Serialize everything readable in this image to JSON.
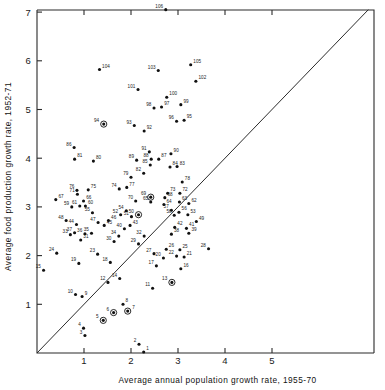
{
  "figure": {
    "title": "",
    "background_color": "#ffffff",
    "ink_color": "#111111"
  },
  "chart_data": {
    "type": "scatter",
    "title": "",
    "xlabel": "Average annual population growth rate, 1955-70",
    "ylabel": "Average food production growth rate, 1952-71",
    "xlim": [
      0,
      5.9
    ],
    "ylim": [
      0,
      7.15
    ],
    "xticks": [
      1,
      2,
      3,
      4,
      5
    ],
    "yticks": [
      1,
      2,
      3,
      4,
      5,
      6,
      7
    ],
    "xtick_labels": [
      "1",
      "2",
      "3",
      "4",
      "5"
    ],
    "ytick_labels": [
      "1",
      "2",
      "3",
      "4",
      "5",
      "6",
      "7"
    ],
    "grid": false,
    "legend": null,
    "annotations": [
      {
        "kind": "reference-line",
        "description": "45-degree diagonal line y = x from origin to top-right corner",
        "x0": 0.0,
        "y0": 0.0,
        "x1": 7.05,
        "y1": 7.05
      }
    ],
    "marker_styles": {
      "plain": "filled black dot",
      "circled": "filled black dot enclosed in an open circle"
    },
    "points": [
      {
        "label": "1",
        "x": 2.27,
        "y": 0.02,
        "style": "plain"
      },
      {
        "label": "2",
        "x": 2.17,
        "y": 0.18,
        "style": "plain"
      },
      {
        "label": "3",
        "x": 1.02,
        "y": 0.36,
        "style": "plain"
      },
      {
        "label": "4",
        "x": 0.99,
        "y": 0.51,
        "style": "plain"
      },
      {
        "label": "5",
        "x": 1.41,
        "y": 0.67,
        "style": "circled"
      },
      {
        "label": "6",
        "x": 1.63,
        "y": 0.83,
        "style": "circled"
      },
      {
        "label": "7",
        "x": 1.93,
        "y": 0.86,
        "style": "circled"
      },
      {
        "label": "8",
        "x": 1.83,
        "y": 1.0,
        "style": "plain"
      },
      {
        "label": "9",
        "x": 0.96,
        "y": 1.16,
        "style": "plain"
      },
      {
        "label": "10",
        "x": 0.82,
        "y": 1.2,
        "style": "plain"
      },
      {
        "label": "11",
        "x": 2.46,
        "y": 1.33,
        "style": "plain"
      },
      {
        "label": "12",
        "x": 1.51,
        "y": 1.45,
        "style": "plain"
      },
      {
        "label": "13",
        "x": 2.87,
        "y": 1.45,
        "style": "circled"
      },
      {
        "label": "14",
        "x": 1.76,
        "y": 1.53,
        "style": "plain"
      },
      {
        "label": "15",
        "x": 0.14,
        "y": 1.7,
        "style": "plain"
      },
      {
        "label": "16",
        "x": 3.06,
        "y": 1.73,
        "style": "plain"
      },
      {
        "label": "17",
        "x": 2.54,
        "y": 1.79,
        "style": "plain"
      },
      {
        "label": "18",
        "x": 1.56,
        "y": 1.86,
        "style": "plain"
      },
      {
        "label": "19",
        "x": 0.89,
        "y": 1.84,
        "style": "plain"
      },
      {
        "label": "20",
        "x": 2.69,
        "y": 1.95,
        "style": "plain"
      },
      {
        "label": "21",
        "x": 3.13,
        "y": 1.97,
        "style": "plain"
      },
      {
        "label": "22",
        "x": 2.97,
        "y": 1.99,
        "style": "plain"
      },
      {
        "label": "23",
        "x": 1.29,
        "y": 2.03,
        "style": "plain"
      },
      {
        "label": "24",
        "x": 0.42,
        "y": 2.05,
        "style": "plain"
      },
      {
        "label": "25",
        "x": 3.04,
        "y": 2.12,
        "style": "plain"
      },
      {
        "label": "26",
        "x": 2.75,
        "y": 2.13,
        "style": "plain"
      },
      {
        "label": "27",
        "x": 2.49,
        "y": 2.04,
        "style": "plain"
      },
      {
        "label": "28",
        "x": 3.65,
        "y": 2.14,
        "style": "plain"
      },
      {
        "label": "29",
        "x": 2.16,
        "y": 2.24,
        "style": "plain"
      },
      {
        "label": "30",
        "x": 1.64,
        "y": 2.29,
        "style": "plain"
      },
      {
        "label": "31",
        "x": 0.93,
        "y": 2.32,
        "style": "plain"
      },
      {
        "label": "32",
        "x": 2.28,
        "y": 2.4,
        "style": "plain"
      },
      {
        "label": "33",
        "x": 0.71,
        "y": 2.43,
        "style": "plain"
      },
      {
        "label": "34",
        "x": 1.74,
        "y": 2.4,
        "style": "plain"
      },
      {
        "label": "35",
        "x": 1.16,
        "y": 2.46,
        "style": "plain"
      },
      {
        "label": "36",
        "x": 1.02,
        "y": 2.45,
        "style": "plain"
      },
      {
        "label": "37",
        "x": 0.8,
        "y": 2.47,
        "style": "plain"
      },
      {
        "label": "38",
        "x": 2.86,
        "y": 2.44,
        "style": "plain"
      },
      {
        "label": "39",
        "x": 3.23,
        "y": 2.46,
        "style": "plain"
      },
      {
        "label": "40",
        "x": 1.86,
        "y": 2.55,
        "style": "plain"
      },
      {
        "label": "41",
        "x": 3.18,
        "y": 2.56,
        "style": "plain"
      },
      {
        "label": "42",
        "x": 2.93,
        "y": 2.58,
        "style": "plain"
      },
      {
        "label": "43",
        "x": 1.98,
        "y": 2.62,
        "style": "plain"
      },
      {
        "label": "44",
        "x": 0.84,
        "y": 2.64,
        "style": "plain"
      },
      {
        "label": "45",
        "x": 1.43,
        "y": 2.62,
        "style": "plain"
      },
      {
        "label": "46",
        "x": 1.52,
        "y": 2.72,
        "style": "plain"
      },
      {
        "label": "47",
        "x": 1.3,
        "y": 2.68,
        "style": "plain"
      },
      {
        "label": "48",
        "x": 0.62,
        "y": 2.72,
        "style": "plain"
      },
      {
        "label": "49",
        "x": 3.39,
        "y": 2.7,
        "style": "plain"
      },
      {
        "label": "50",
        "x": 2.16,
        "y": 2.84,
        "style": "circled"
      },
      {
        "label": "51",
        "x": 2.01,
        "y": 2.8,
        "style": "plain"
      },
      {
        "label": "52",
        "x": 1.78,
        "y": 2.84,
        "style": "plain"
      },
      {
        "label": "53",
        "x": 3.21,
        "y": 2.84,
        "style": "plain"
      },
      {
        "label": "54",
        "x": 1.9,
        "y": 2.92,
        "style": "plain"
      },
      {
        "label": "55",
        "x": 1.18,
        "y": 2.88,
        "style": "plain"
      },
      {
        "label": "56",
        "x": 3.02,
        "y": 2.89,
        "style": "plain"
      },
      {
        "label": "57",
        "x": 2.86,
        "y": 2.93,
        "style": "plain"
      },
      {
        "label": "58",
        "x": 2.92,
        "y": 2.83,
        "style": "plain"
      },
      {
        "label": "59",
        "x": 0.74,
        "y": 3.0,
        "style": "plain"
      },
      {
        "label": "60",
        "x": 1.03,
        "y": 3.02,
        "style": "plain"
      },
      {
        "label": "61",
        "x": 0.91,
        "y": 3.02,
        "style": "plain"
      },
      {
        "label": "62",
        "x": 3.23,
        "y": 3.07,
        "style": "plain"
      },
      {
        "label": "63",
        "x": 3.03,
        "y": 3.1,
        "style": "plain"
      },
      {
        "label": "64",
        "x": 2.7,
        "y": 3.05,
        "style": "plain"
      },
      {
        "label": "65",
        "x": 2.42,
        "y": 3.1,
        "style": "plain"
      },
      {
        "label": "66",
        "x": 0.99,
        "y": 3.12,
        "style": "plain"
      },
      {
        "label": "67",
        "x": 0.4,
        "y": 3.15,
        "style": "plain"
      },
      {
        "label": "68",
        "x": 2.72,
        "y": 3.19,
        "style": "plain"
      },
      {
        "label": "69",
        "x": 2.42,
        "y": 3.2,
        "style": "circled"
      },
      {
        "label": "70",
        "x": 2.1,
        "y": 3.12,
        "style": "plain"
      },
      {
        "label": "71",
        "x": 0.86,
        "y": 3.26,
        "style": "plain"
      },
      {
        "label": "72",
        "x": 3.04,
        "y": 3.28,
        "style": "plain"
      },
      {
        "label": "73",
        "x": 2.78,
        "y": 3.28,
        "style": "plain"
      },
      {
        "label": "74",
        "x": 1.75,
        "y": 3.37,
        "style": "plain"
      },
      {
        "label": "75",
        "x": 1.09,
        "y": 3.35,
        "style": "plain"
      },
      {
        "label": "76",
        "x": 0.85,
        "y": 3.34,
        "style": "plain"
      },
      {
        "label": "77",
        "x": 1.91,
        "y": 3.4,
        "style": "plain"
      },
      {
        "label": "78",
        "x": 3.09,
        "y": 3.51,
        "style": "plain"
      },
      {
        "label": "79",
        "x": 2.0,
        "y": 3.61,
        "style": "plain"
      },
      {
        "label": "80",
        "x": 1.2,
        "y": 3.94,
        "style": "plain"
      },
      {
        "label": "81",
        "x": 0.8,
        "y": 3.98,
        "style": "plain"
      },
      {
        "label": "82",
        "x": 2.27,
        "y": 3.69,
        "style": "plain"
      },
      {
        "label": "83",
        "x": 2.98,
        "y": 3.83,
        "style": "plain"
      },
      {
        "label": "84",
        "x": 2.83,
        "y": 3.82,
        "style": "plain"
      },
      {
        "label": "85",
        "x": 2.41,
        "y": 3.86,
        "style": "plain"
      },
      {
        "label": "86",
        "x": 0.79,
        "y": 4.22,
        "style": "plain"
      },
      {
        "label": "87",
        "x": 2.59,
        "y": 3.98,
        "style": "plain"
      },
      {
        "label": "88",
        "x": 2.43,
        "y": 3.98,
        "style": "plain"
      },
      {
        "label": "89",
        "x": 2.12,
        "y": 3.96,
        "style": "plain"
      },
      {
        "label": "90",
        "x": 2.85,
        "y": 4.09,
        "style": "plain"
      },
      {
        "label": "91",
        "x": 2.39,
        "y": 4.13,
        "style": "plain"
      },
      {
        "label": "92",
        "x": 2.28,
        "y": 4.56,
        "style": "plain"
      },
      {
        "label": "93",
        "x": 2.07,
        "y": 4.67,
        "style": "plain"
      },
      {
        "label": "94",
        "x": 1.42,
        "y": 4.7,
        "style": "circled"
      },
      {
        "label": "95",
        "x": 3.13,
        "y": 4.78,
        "style": "plain"
      },
      {
        "label": "96",
        "x": 2.97,
        "y": 4.76,
        "style": "plain"
      },
      {
        "label": "97",
        "x": 2.65,
        "y": 5.05,
        "style": "plain"
      },
      {
        "label": "98",
        "x": 2.49,
        "y": 5.03,
        "style": "plain"
      },
      {
        "label": "99",
        "x": 3.06,
        "y": 5.1,
        "style": "plain"
      },
      {
        "label": "100",
        "x": 2.76,
        "y": 5.25,
        "style": "plain"
      },
      {
        "label": "101",
        "x": 2.15,
        "y": 5.41,
        "style": "plain"
      },
      {
        "label": "102",
        "x": 3.38,
        "y": 5.58,
        "style": "plain"
      },
      {
        "label": "103",
        "x": 2.58,
        "y": 5.8,
        "style": "plain"
      },
      {
        "label": "104",
        "x": 1.33,
        "y": 5.82,
        "style": "plain"
      },
      {
        "label": "105",
        "x": 3.27,
        "y": 5.92,
        "style": "plain"
      },
      {
        "label": "106",
        "x": 2.74,
        "y": 7.05,
        "style": "plain"
      }
    ]
  }
}
